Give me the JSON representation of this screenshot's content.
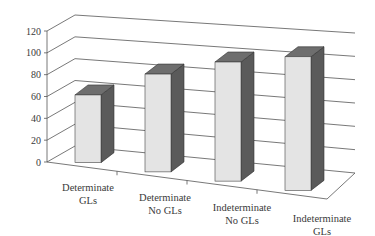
{
  "chart_data": {
    "type": "bar",
    "style": "3d-column",
    "title": "",
    "xlabel": "",
    "ylabel": "",
    "ylim": [
      0,
      120
    ],
    "yticks": [
      0,
      20,
      40,
      60,
      80,
      100,
      120
    ],
    "grid": true,
    "legend": null,
    "categories": [
      [
        "Determinate",
        "GLs"
      ],
      [
        "Determinate",
        "No GLs"
      ],
      [
        "Indeterminate",
        "No GLs"
      ],
      [
        "Indeterminate",
        "GLs"
      ]
    ],
    "category_labels": [
      "Determinate GLs",
      "Determinate No GLs",
      "Indeterminate No GLs",
      "Indeterminate GLs"
    ],
    "values": [
      62,
      80,
      88,
      90
    ]
  },
  "colors": {
    "bar_front": "#e4e4e4",
    "bar_side": "#5a5a5a",
    "bar_top": "#6e6e6e",
    "gridline": "#555555",
    "text": "#3a3a3a"
  }
}
